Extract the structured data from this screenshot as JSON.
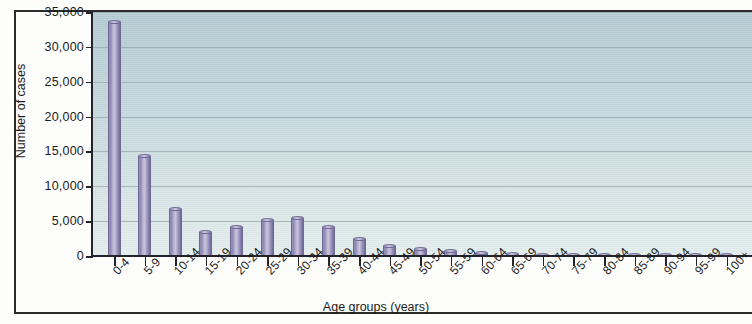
{
  "chart_data": {
    "type": "bar",
    "title": "",
    "xlabel": "Age groups (years)",
    "ylabel": "Number of cases",
    "ylim": [
      0,
      35000
    ],
    "ytick_labels": [
      "0",
      "5,000",
      "10,000",
      "15,000",
      "20,000",
      "25,000",
      "30,000",
      "35,000"
    ],
    "ytick_values": [
      0,
      5000,
      10000,
      15000,
      20000,
      25000,
      30000,
      35000
    ],
    "grid": true,
    "legend": "none",
    "bar_color": "#8d86b2",
    "plot_bg_top": "#b7ccd4",
    "plot_bg_bottom": "#e4eeee",
    "categories": [
      "0-4",
      "5-9",
      "10-14",
      "15-19",
      "20-24",
      "25-29",
      "30-34",
      "35-39",
      "40-44",
      "45-49",
      "50-54",
      "55-59",
      "60-64",
      "65-69",
      "70-74",
      "75-79",
      "80-84",
      "85-89",
      "90-94",
      "95-99",
      "100+"
    ],
    "values": [
      33500,
      14400,
      6800,
      3500,
      4200,
      5200,
      5400,
      4100,
      2400,
      1500,
      1000,
      700,
      500,
      250,
      200,
      150,
      60,
      40,
      25,
      15,
      10
    ]
  }
}
